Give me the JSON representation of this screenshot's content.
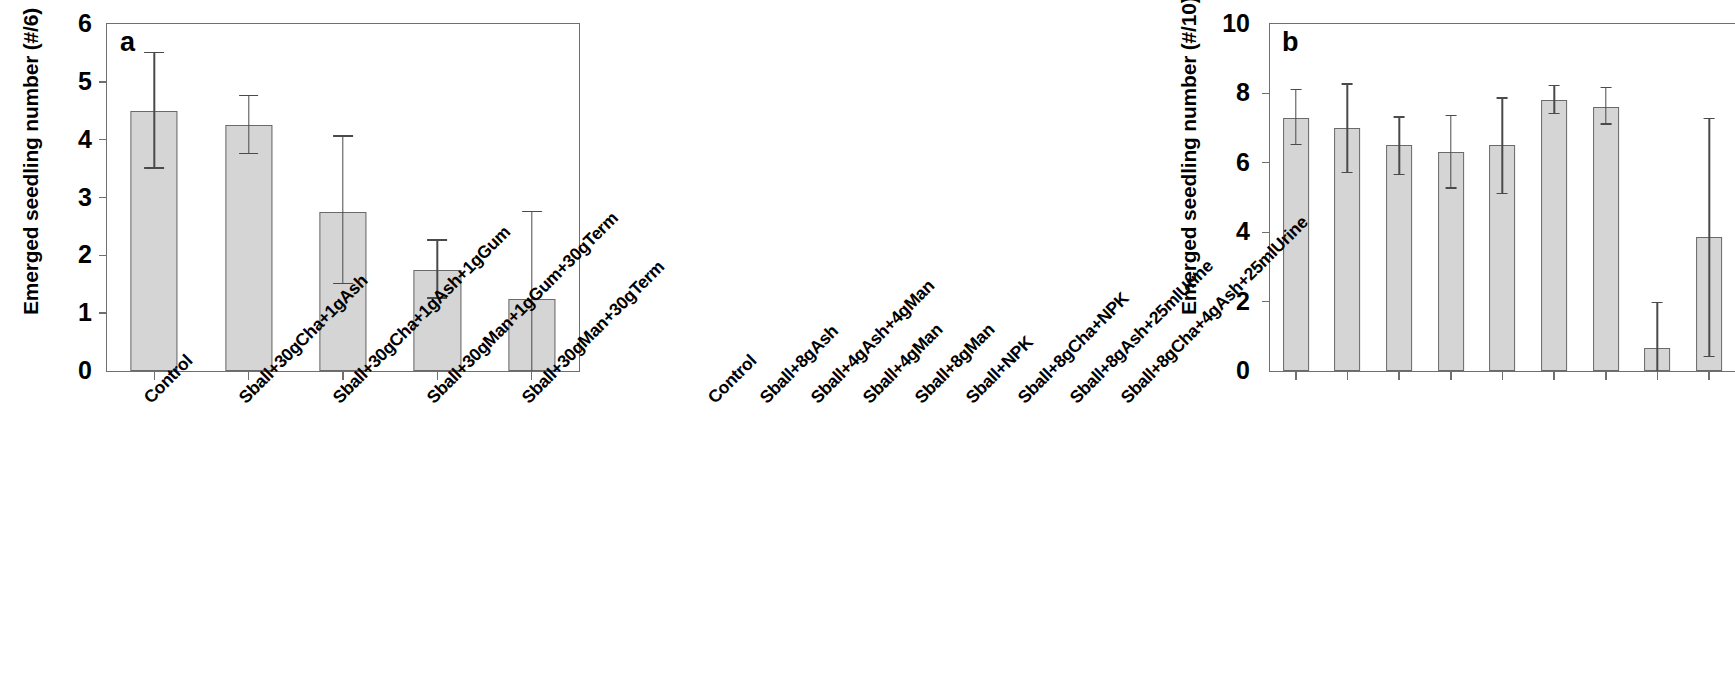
{
  "figure": {
    "panels": [
      {
        "letter": "a",
        "ylabel": "Emerged seedling number (#/6)",
        "yticks": [
          "0",
          "1",
          "2",
          "3",
          "4",
          "5",
          "6"
        ]
      },
      {
        "letter": "b",
        "ylabel": "Emerged seedling number (#/10)",
        "yticks": [
          "0",
          "2",
          "4",
          "6",
          "8",
          "10"
        ]
      }
    ]
  },
  "chart_data": [
    {
      "type": "bar",
      "panel": "a",
      "title": "",
      "xlabel": "",
      "ylabel": "Emerged seedling number (#/6)",
      "ylim": [
        0,
        6
      ],
      "ytick_values": [
        0,
        1,
        2,
        3,
        4,
        5,
        6
      ],
      "grid": false,
      "legend": "none",
      "categories": [
        "Control",
        "Sball+30gCha+1gAsh",
        "Sball+30gCha+1gAsh+1gGum",
        "Sball+30gMan+1gGum+30gTerm",
        "Sball+30gMan+30gTerm"
      ],
      "values": [
        4.5,
        4.25,
        2.75,
        1.75,
        1.25
      ],
      "error_low": [
        3.5,
        3.75,
        1.5,
        1.25,
        0.0
      ],
      "error_high": [
        5.5,
        4.75,
        4.05,
        2.25,
        2.75
      ],
      "error_type": "error bars (low-high)"
    },
    {
      "type": "bar",
      "panel": "b",
      "title": "",
      "xlabel": "",
      "ylabel": "Emerged seedling number (#/10)",
      "ylim": [
        0,
        10
      ],
      "ytick_values": [
        0,
        2,
        4,
        6,
        8,
        10
      ],
      "grid": false,
      "legend": "none",
      "categories": [
        "Control",
        "Sball+8gAsh",
        "Sball+4gAsh+4gMan",
        "Sball+4gMan",
        "Sball+8gMan",
        "Sball+NPK",
        "Sball+8gCha+NPK",
        "Sball+8gAsh+25mlUrine",
        "Sball+8gCha+4gAsh+25mlUrine"
      ],
      "values": [
        7.3,
        7.0,
        6.5,
        6.3,
        6.5,
        7.8,
        7.6,
        0.65,
        3.85
      ],
      "error_low": [
        6.5,
        5.7,
        5.65,
        5.25,
        5.1,
        7.4,
        7.1,
        0.0,
        0.4
      ],
      "error_high": [
        8.1,
        8.25,
        7.3,
        7.35,
        7.85,
        8.2,
        8.15,
        1.95,
        7.25
      ],
      "error_type": "error bars (low-high)"
    }
  ]
}
